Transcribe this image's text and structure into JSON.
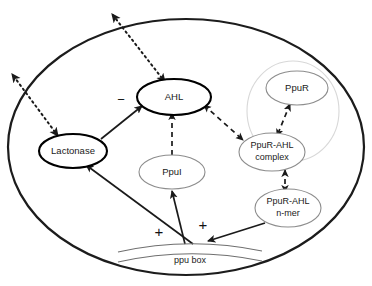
{
  "diagram": {
    "cell": {
      "name": "bacterial cell outline"
    },
    "nodes": [
      {
        "id": "ahl",
        "label": "AHL",
        "style": "bold"
      },
      {
        "id": "lactonase",
        "label": "Lactonase",
        "style": "bold"
      },
      {
        "id": "ppui",
        "label": "PpuI",
        "style": "thin"
      },
      {
        "id": "ppur",
        "label": "PpuR",
        "style": "thin"
      },
      {
        "id": "ppur_ahl_line1",
        "label": "PpuR-AHL",
        "style": "thin"
      },
      {
        "id": "ppur_ahl_line2",
        "label": "complex",
        "style": "thin"
      },
      {
        "id": "nmer_line1",
        "label": "PpuR-AHL",
        "style": "thin"
      },
      {
        "id": "nmer_line2",
        "label": "n-mer",
        "style": "thin"
      },
      {
        "id": "ppubox",
        "label": "ppu box",
        "style": "operator"
      }
    ],
    "signs": [
      {
        "id": "minus-ahl",
        "label": "−"
      },
      {
        "id": "plus-lactonase",
        "label": "+"
      },
      {
        "id": "plus-ppui",
        "label": "+"
      }
    ],
    "edges": [
      {
        "id": "lactonase-to-ahl",
        "type": "solid",
        "sign": "−"
      },
      {
        "id": "ppui-to-ahl",
        "type": "dashed",
        "sign": ""
      },
      {
        "id": "ahl-to-complex",
        "type": "dashed",
        "sign": ""
      },
      {
        "id": "ppur-to-complex",
        "type": "dashed",
        "sign": ""
      },
      {
        "id": "complex-to-nmer",
        "type": "dashed",
        "sign": ""
      },
      {
        "id": "nmer-to-ppubox",
        "type": "solid",
        "sign": ""
      },
      {
        "id": "ppubox-to-lactonase",
        "type": "solid",
        "sign": "+"
      },
      {
        "id": "ppubox-to-ppui",
        "type": "solid",
        "sign": "+"
      },
      {
        "id": "ahl-membrane-export",
        "type": "dotted",
        "sign": ""
      },
      {
        "id": "lactonase-membrane",
        "type": "dotted",
        "sign": ""
      }
    ],
    "colors": {
      "outline": "#1c1c1c",
      "node_bold": "#000000",
      "node_thin": "#8d8d8d",
      "node_faint": "#d8d8d8",
      "text": "#1a1a1a",
      "background": "#ffffff"
    }
  }
}
